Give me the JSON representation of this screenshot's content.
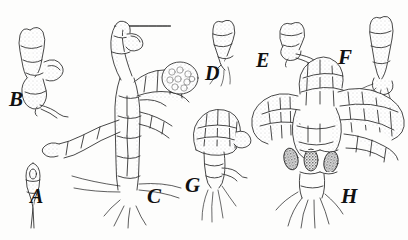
{
  "plate": {
    "title": "Comparative plate of branched filamentous thalli (A-H)",
    "background_color": "#fdfdfc",
    "ink_color": "#1a1a1a",
    "stipple_color": "#8d8d8d",
    "sporangium_color": "#3b3b3b",
    "style": "pen-and-ink line drawing with stippled shading",
    "specimen_count": 8
  },
  "labels": [
    {
      "id": "A",
      "text": "A",
      "x": 30,
      "y": 196,
      "size": 20
    },
    {
      "id": "B",
      "text": "B",
      "x": 9,
      "y": 99,
      "size": 21
    },
    {
      "id": "C",
      "text": "C",
      "x": 147,
      "y": 196,
      "size": 21
    },
    {
      "id": "D",
      "text": "D",
      "x": 205,
      "y": 73,
      "size": 20
    },
    {
      "id": "E",
      "text": "E",
      "x": 256,
      "y": 60,
      "size": 20
    },
    {
      "id": "F",
      "text": "F",
      "x": 338,
      "y": 57,
      "size": 21
    },
    {
      "id": "G",
      "text": "G",
      "x": 185,
      "y": 185,
      "size": 21
    },
    {
      "id": "H",
      "text": "H",
      "x": 341,
      "y": 196,
      "size": 21
    }
  ],
  "specimens": [
    {
      "id": "A",
      "label": "A",
      "description": "Single spindle-shaped cell on a long tapering stalk",
      "features": [
        "spindle cell",
        "tapering stalk",
        "internal nucleus"
      ],
      "position": {
        "x": 22,
        "y": 160,
        "w": 26,
        "h": 58
      }
    },
    {
      "id": "B",
      "label": "B",
      "description": "Short erect filament of 4-5 cells with a lateral branch and basal holdfast",
      "features": [
        "uniseriate filament",
        "lateral branch",
        "basal cell",
        "holdfast"
      ],
      "position": {
        "x": 8,
        "y": 22,
        "w": 62,
        "h": 80
      }
    },
    {
      "id": "C",
      "label": "C",
      "description": "Large branched thallus with an erect axis, spreading lateral branches, a dense globular cell cluster and basal rhizoids",
      "features": [
        "main axis",
        "lateral branches",
        "globular cell cluster",
        "rhizoids"
      ],
      "position": {
        "x": 72,
        "y": 14,
        "w": 110,
        "h": 200
      }
    },
    {
      "id": "D",
      "label": "D",
      "description": "Short curved uniseriate filament of stacked cells with fine basal hairs",
      "features": [
        "uniseriate filament",
        "curved axis",
        "basal hairs"
      ],
      "position": {
        "x": 212,
        "y": 20,
        "w": 28,
        "h": 52
      }
    },
    {
      "id": "E",
      "label": "E",
      "description": "Small club-shaped cell cluster with a curved basal outgrowth",
      "features": [
        "club-shaped head",
        "basal outgrowth"
      ],
      "position": {
        "x": 280,
        "y": 22,
        "w": 40,
        "h": 36
      }
    },
    {
      "id": "F",
      "label": "F",
      "description": "Erect filament with a swollen apical cell and branching rhizoids at the base",
      "features": [
        "erect filament",
        "apical cell",
        "branching rhizoids"
      ],
      "position": {
        "x": 368,
        "y": 14,
        "w": 32,
        "h": 92
      }
    },
    {
      "id": "G",
      "label": "G",
      "description": "Fan-shaped multicellular head borne on a short stalk with trailing rhizoids",
      "features": [
        "fan-shaped head",
        "stalk",
        "trailing rhizoids"
      ],
      "position": {
        "x": 190,
        "y": 112,
        "w": 46,
        "h": 110
      }
    },
    {
      "id": "H",
      "label": "H",
      "description": "Large mature thallus with several radiating fan-shaped lobes, three dark sporangia at the centre and a tuft of basal rhizoids",
      "features": [
        "radiating fan lobes",
        "central axis",
        "sporangia",
        "basal rhizoid tuft"
      ],
      "position": {
        "x": 252,
        "y": 82,
        "w": 150,
        "h": 150
      },
      "sporangia_count": 3
    }
  ]
}
